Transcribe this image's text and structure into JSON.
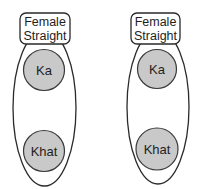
{
  "diagram": {
    "groups": [
      {
        "label_line1": "Female",
        "label_line2": "Straight",
        "nodes": [
          {
            "label": "Ka"
          },
          {
            "label": "Khat"
          }
        ]
      },
      {
        "label_line1": "Female",
        "label_line2": "Straight",
        "nodes": [
          {
            "label": "Ka"
          },
          {
            "label": "Khat"
          }
        ]
      }
    ],
    "colors": {
      "node_fill": "#c9c9c9",
      "stroke": "#2a2a2a",
      "background": "#ffffff"
    }
  }
}
